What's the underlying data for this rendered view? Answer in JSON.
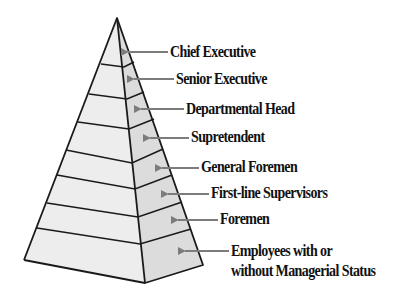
{
  "diagram": {
    "type": "pyramid",
    "title": "",
    "colors": {
      "left_face": "#ededed",
      "right_face": "#dcdcdc",
      "edge": "#1a1a1a",
      "arrow": "#7c7c7c",
      "text": "#111111"
    },
    "levels": [
      {
        "label": "Chief Executive",
        "lines": [
          "Chief Executive"
        ]
      },
      {
        "label": "Senior Executive",
        "lines": [
          "Senior Executive"
        ]
      },
      {
        "label": "Departmental Head",
        "lines": [
          "Departmental Head"
        ]
      },
      {
        "label": "Supretendent",
        "lines": [
          "Supretendent"
        ]
      },
      {
        "label": "General Foremen",
        "lines": [
          "General Foremen"
        ]
      },
      {
        "label": "First-line Supervisors",
        "lines": [
          "First-line Supervisors"
        ]
      },
      {
        "label": "Foremen",
        "lines": [
          "Foremen"
        ]
      },
      {
        "label": "Employees with or without Managerial Status",
        "lines": [
          "Employees with or",
          "without Managerial Status"
        ]
      }
    ]
  }
}
